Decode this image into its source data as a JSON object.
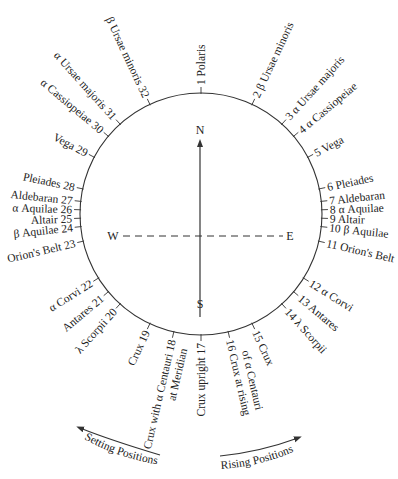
{
  "diagram": {
    "center": {
      "x": 201,
      "y": 214
    },
    "radius": 121,
    "line_color": "#333333",
    "directions": {
      "north": "N",
      "south": "S",
      "east": "E",
      "west": "W"
    },
    "points": [
      {
        "n": 1,
        "label": "1 Polaris",
        "angle": 0,
        "side": "right"
      },
      {
        "n": 2,
        "label": "2 β Ursae minoris",
        "angle": 25,
        "side": "right"
      },
      {
        "n": 3,
        "label": "3 α Ursae majoris",
        "angle": 42,
        "side": "right"
      },
      {
        "n": 4,
        "label": "4 α Cassiopeiae",
        "angle": 50,
        "side": "right"
      },
      {
        "n": 5,
        "label": "5 Vega",
        "angle": 62,
        "side": "right"
      },
      {
        "n": 6,
        "label": "6 Pleiades",
        "angle": 78,
        "side": "right"
      },
      {
        "n": 7,
        "label": "7 Aldebaran",
        "angle": 84,
        "side": "right"
      },
      {
        "n": 8,
        "label": "8 α Aquilae",
        "angle": 88,
        "side": "right"
      },
      {
        "n": 9,
        "label": "9 Altair",
        "angle": 92,
        "side": "right"
      },
      {
        "n": 10,
        "label": "10 β  Aquilae",
        "angle": 96,
        "side": "right"
      },
      {
        "n": 11,
        "label": "11 Orion's Belt",
        "angle": 103,
        "side": "right"
      },
      {
        "n": 12,
        "label": "12 α Corvi",
        "angle": 122,
        "side": "right"
      },
      {
        "n": 13,
        "label": "13 Antares",
        "angle": 130,
        "side": "right"
      },
      {
        "n": 14,
        "label": "14 λ Scorpii",
        "angle": 138,
        "side": "right"
      },
      {
        "n": 15,
        "label": "15 Crux",
        "angle": 155,
        "side": "right"
      },
      {
        "n": 16,
        "label": "16 Crux at rising",
        "label2": "of α Centauri",
        "angle": 167,
        "side": "right"
      },
      {
        "n": 17,
        "label": "Crux upright 17",
        "angle": 180,
        "side": "left"
      },
      {
        "n": 18,
        "label": "Crux with α Centauri 18",
        "label2": "at Meridian",
        "angle": 193,
        "side": "left"
      },
      {
        "n": 19,
        "label": "Crux 19",
        "angle": 205,
        "side": "left"
      },
      {
        "n": 20,
        "label": "λ Scorpii 20",
        "angle": 222,
        "side": "left"
      },
      {
        "n": 21,
        "label": "Antares 21",
        "angle": 230,
        "side": "left"
      },
      {
        "n": 22,
        "label": "α Corvi 22",
        "angle": 238,
        "side": "left"
      },
      {
        "n": 23,
        "label": "Orion's Belt 23",
        "angle": 257,
        "side": "left"
      },
      {
        "n": 24,
        "label": "β Aquilae 24",
        "angle": 264,
        "side": "left"
      },
      {
        "n": 25,
        "label": "Altair 25",
        "angle": 268,
        "side": "left"
      },
      {
        "n": 26,
        "label": "α Aquilae 26",
        "angle": 272,
        "side": "left"
      },
      {
        "n": 27,
        "label": "Aldebaran 27",
        "angle": 276,
        "side": "left"
      },
      {
        "n": 28,
        "label": "Pleiades 28",
        "angle": 282,
        "side": "left"
      },
      {
        "n": 29,
        "label": "Vega 29",
        "angle": 298,
        "side": "left"
      },
      {
        "n": 30,
        "label": "α Cassiopeiae 30",
        "angle": 310,
        "side": "left"
      },
      {
        "n": 31,
        "label": "α Ursae majoris 31",
        "angle": 318,
        "side": "left"
      },
      {
        "n": 32,
        "label": "β Ursae minoris 32",
        "angle": 335,
        "side": "left"
      }
    ],
    "captions": {
      "setting": "Setting Positions",
      "rising": "Rising Positions"
    }
  }
}
